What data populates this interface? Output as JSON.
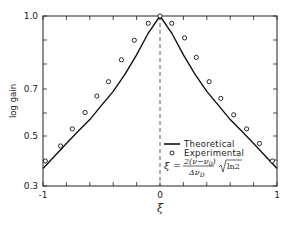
{
  "chart_data": {
    "type": "line",
    "title": "",
    "xlabel": "ξ",
    "ylabel": "log gain",
    "xlim": [
      -1,
      1
    ],
    "ylim": [
      0.3,
      1.0
    ],
    "x_ticks": [
      -1,
      -0.8,
      -0.6,
      -0.4,
      -0.2,
      0,
      0.2,
      0.4,
      0.6,
      0.8,
      1
    ],
    "x_tick_labels": [
      "-1",
      "0",
      "1"
    ],
    "y_tick_labels": [
      "1.0",
      "0.7",
      "0.5",
      "0.3"
    ],
    "grid": false,
    "center_line": {
      "x": 0,
      "style": "dashed"
    },
    "legend": {
      "position": "lower right",
      "entries": [
        {
          "label": "Theoretical",
          "marker": "line"
        },
        {
          "label": "Experimental",
          "marker": "open-circle"
        }
      ],
      "formula": "ξ = 2(ν−ν0)/Δν0 · √ln2"
    },
    "series": [
      {
        "name": "Theoretical",
        "style": "solid-line",
        "x": [
          -1,
          -0.9,
          -0.8,
          -0.7,
          -0.6,
          -0.5,
          -0.4,
          -0.3,
          -0.2,
          -0.1,
          0,
          0.1,
          0.2,
          0.3,
          0.4,
          0.5,
          0.6,
          0.7,
          0.8,
          0.9,
          1
        ],
        "y": [
          0.37,
          0.42,
          0.47,
          0.52,
          0.57,
          0.63,
          0.69,
          0.76,
          0.84,
          0.93,
          1.0,
          0.93,
          0.84,
          0.76,
          0.69,
          0.63,
          0.57,
          0.52,
          0.47,
          0.42,
          0.37
        ]
      },
      {
        "name": "Experimental",
        "style": "open-circle",
        "x": [
          -0.98,
          -0.85,
          -0.75,
          -0.64,
          -0.54,
          -0.44,
          -0.33,
          -0.22,
          -0.1,
          0,
          0.1,
          0.21,
          0.31,
          0.42,
          0.52,
          0.63,
          0.74,
          0.85,
          0.96
        ],
        "y": [
          0.4,
          0.46,
          0.53,
          0.6,
          0.67,
          0.73,
          0.82,
          0.9,
          0.97,
          1.0,
          0.97,
          0.91,
          0.83,
          0.73,
          0.66,
          0.59,
          0.53,
          0.47,
          0.4
        ]
      }
    ]
  },
  "axes": {
    "y_title": "log gain",
    "x_title": "ξ",
    "x_labels": {
      "left": "-1",
      "center": "0",
      "right": "1"
    },
    "y_labels": {
      "top": "1.0",
      "mid1": "0.7",
      "mid2": "0.5",
      "bottom": "0.3"
    }
  },
  "legend": {
    "theoretical": "Theoretical",
    "experimental": "Experimental",
    "formula_lhs": "ξ =",
    "formula_num": "2(ν−ν",
    "formula_num_sub": "0",
    "formula_num_close": ")",
    "formula_den": "Δν",
    "formula_den_sub": "D",
    "formula_sqrt": "ln2"
  },
  "colors": {
    "ink": "#222222",
    "background": "#ffffff"
  }
}
